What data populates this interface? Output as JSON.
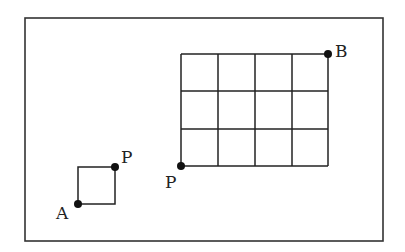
{
  "diagram": {
    "frame": {
      "x1": 25,
      "y1": 18,
      "x2": 383,
      "y2": 241
    },
    "small_square": {
      "corner_A": {
        "label": "A",
        "x": 78,
        "y": 204
      },
      "corner_P": {
        "label": "P",
        "x": 115,
        "y": 167
      }
    },
    "grid": {
      "columns": 4,
      "rows": 3,
      "origin_P": {
        "label": "P",
        "x": 181,
        "y": 166
      },
      "end_B": {
        "label": "B",
        "x": 328,
        "y": 54
      }
    },
    "labels": {
      "A": "A",
      "P_small": "P",
      "P_grid": "P",
      "B": "B"
    },
    "colors": {
      "line": "#222222",
      "dot": "#111111",
      "background": "#ffffff"
    }
  }
}
